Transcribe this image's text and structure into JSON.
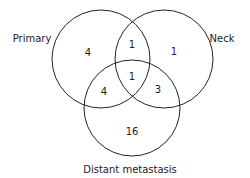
{
  "diagram": {
    "type": "venn",
    "sets": [
      {
        "label": "Primary"
      },
      {
        "label": "Neck"
      },
      {
        "label": "Distant metastasis"
      }
    ],
    "regions": {
      "primary_only": "4",
      "neck_only": "1",
      "distant_only": "16",
      "primary_neck": "1",
      "primary_distant": "4",
      "neck_distant": "3",
      "all_three": "1"
    },
    "colors": {
      "stroke": "#222222",
      "background": "#ffffff"
    }
  }
}
